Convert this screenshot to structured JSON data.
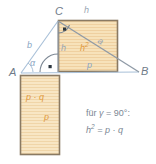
{
  "figure": {
    "type": "geometry-diagram",
    "width": 156,
    "height": 164
  },
  "colors": {
    "square_fill": "#f6dfb4",
    "square_fill_alt": "#f7e3bd",
    "square_border": "#8a7a63",
    "line_blue": "#a8c0d8",
    "line_gray": "#8f9aa6",
    "label_blue": "#8aa6c4",
    "label_orange": "#e09a3e",
    "label_gray": "#9aa7b4",
    "vertex_gray": "#6f7b89",
    "text_gray": "#7b8794",
    "hatch": "#eccb96",
    "background": "#ffffff"
  },
  "vertices": [
    {
      "name": "vertex-a",
      "label": "A",
      "x": 16,
      "y": 73
    },
    {
      "name": "vertex-b",
      "label": "B",
      "x": 140,
      "y": 72
    },
    {
      "name": "vertex-c",
      "label": "C",
      "x": 58,
      "y": 20
    }
  ],
  "segment_labels": [
    {
      "name": "side-b-label",
      "label": "b",
      "x": 29,
      "y": 46,
      "color": "blue"
    },
    {
      "name": "side-a-label",
      "label": "a",
      "x": 99,
      "y": 41,
      "color": "gray"
    },
    {
      "name": "altitude-h-label",
      "label": "h",
      "x": 60,
      "y": 48,
      "color": "gray"
    },
    {
      "name": "top-edge-h-label",
      "label": "h",
      "x": 85,
      "y": 10,
      "color": "gray"
    },
    {
      "name": "segment-p-label",
      "label": "p",
      "x": 88,
      "y": 65,
      "color": "blue"
    },
    {
      "name": "angle-alpha-label",
      "label": "α",
      "x": 31,
      "y": 62,
      "color": "blue"
    },
    {
      "name": "rectangle-side-p-label",
      "label": "p",
      "x": 45,
      "y": 117,
      "color": "orange"
    }
  ],
  "area_labels": [
    {
      "name": "square-h-squared-label",
      "base": "h",
      "sup": "2",
      "x": 82,
      "y": 46,
      "color": "orange"
    },
    {
      "name": "rectangle-pq-label",
      "text": "p · q",
      "x": 28,
      "y": 97,
      "color": "orange"
    }
  ],
  "shapes": {
    "square_h2": {
      "name": "square-h-squared",
      "x": 58,
      "y": 20,
      "width": 60,
      "height": 52
    },
    "rectangle_pq": {
      "name": "rectangle-p-times-q",
      "x": 20,
      "y": 75,
      "width": 40,
      "height": 80
    }
  },
  "markers": [
    {
      "name": "right-angle-marker-c",
      "x": 64,
      "y": 29
    },
    {
      "name": "right-angle-marker-foot",
      "x": 50,
      "y": 67
    },
    {
      "name": "angle-arc-c"
    },
    {
      "name": "angle-arc-alpha"
    },
    {
      "name": "angle-arc-foot"
    }
  ],
  "formula": {
    "condition_prefix": "für ",
    "condition_symbol": "γ",
    "condition_equals": " = ",
    "condition_value": "90°:",
    "line1": "für γ = 90°:",
    "result_base": "h",
    "result_sup": "2",
    "result_rest": " = p · q",
    "line2": "h² = p · q"
  }
}
